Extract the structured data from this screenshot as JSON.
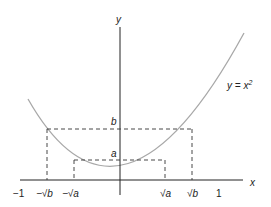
{
  "diagram": {
    "title": "",
    "axes": {
      "x_label": "x",
      "y_label": "y"
    },
    "curve": {
      "label_y": "y = x",
      "label_exp": "2",
      "color": "#a0a0a0"
    },
    "x_ticks": [
      {
        "label": "−1"
      },
      {
        "label": "−√b"
      },
      {
        "label": "−√a"
      },
      {
        "label": "√a"
      },
      {
        "label": "√b"
      },
      {
        "label": "1"
      }
    ],
    "y_ticks": [
      {
        "label": "b"
      },
      {
        "label": "a"
      }
    ],
    "colors": {
      "axis": "#222222",
      "dashed": "#333333",
      "curve": "#a0a0a0"
    }
  }
}
